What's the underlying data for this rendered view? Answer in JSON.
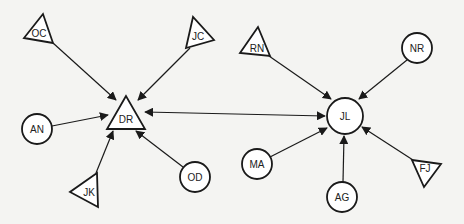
{
  "diagram": {
    "type": "directed-network",
    "colors": {
      "background": "#f4f4f2",
      "node_fill": "#ffffff",
      "stroke": "#1a1a1a",
      "text": "#222222"
    },
    "nodes": [
      {
        "id": "OC",
        "label": "OC",
        "shape": "triangle",
        "points": [
          [
            43,
            14
          ],
          [
            24,
            38
          ],
          [
            53,
            43
          ]
        ],
        "label_pos": [
          39,
          33
        ]
      },
      {
        "id": "JC",
        "label": "JC",
        "shape": "triangle",
        "points": [
          [
            193,
            17
          ],
          [
            186,
            48
          ],
          [
            214,
            40
          ]
        ],
        "label_pos": [
          198,
          36
        ]
      },
      {
        "id": "DR",
        "label": "DR",
        "shape": "triangle",
        "points": [
          [
            126,
            96
          ],
          [
            107,
            129
          ],
          [
            145,
            129
          ]
        ],
        "label_pos": [
          126,
          119
        ]
      },
      {
        "id": "AN",
        "label": "AN",
        "shape": "circle",
        "cx": 37,
        "cy": 129,
        "r": 15
      },
      {
        "id": "JK",
        "label": "JK",
        "shape": "triangle",
        "points": [
          [
            97,
            173
          ],
          [
            70,
            192
          ],
          [
            98,
            207
          ]
        ],
        "label_pos": [
          89,
          192
        ]
      },
      {
        "id": "OD",
        "label": "OD",
        "shape": "circle",
        "cx": 195,
        "cy": 177,
        "r": 15
      },
      {
        "id": "RN",
        "label": "RN",
        "shape": "triangle",
        "points": [
          [
            258,
            27
          ],
          [
            240,
            53
          ],
          [
            270,
            56
          ]
        ],
        "label_pos": [
          257,
          48
        ]
      },
      {
        "id": "NR",
        "label": "NR",
        "shape": "circle",
        "cx": 417,
        "cy": 48,
        "r": 15
      },
      {
        "id": "JL",
        "label": "JL",
        "shape": "circle",
        "cx": 345,
        "cy": 116,
        "r": 18
      },
      {
        "id": "MA",
        "label": "MA",
        "shape": "circle",
        "cx": 257,
        "cy": 164,
        "r": 15
      },
      {
        "id": "AG",
        "label": "AG",
        "shape": "circle",
        "cx": 342,
        "cy": 197,
        "r": 15
      },
      {
        "id": "FJ",
        "label": "FJ",
        "shape": "triangle",
        "points": [
          [
            412,
            160
          ],
          [
            441,
            164
          ],
          [
            424,
            187
          ]
        ],
        "label_pos": [
          425,
          168
        ]
      }
    ],
    "edges": [
      {
        "from": "OC",
        "to": "DR",
        "x1": 53,
        "y1": 43,
        "x2": 116,
        "y2": 100,
        "bidirectional": false
      },
      {
        "from": "JC",
        "to": "DR",
        "x1": 190,
        "y1": 48,
        "x2": 138,
        "y2": 100,
        "bidirectional": false
      },
      {
        "from": "AN",
        "to": "DR",
        "x1": 52,
        "y1": 126,
        "x2": 108,
        "y2": 115,
        "bidirectional": false
      },
      {
        "from": "JK",
        "to": "DR",
        "x1": 96,
        "y1": 173,
        "x2": 113,
        "y2": 131,
        "bidirectional": false
      },
      {
        "from": "OD",
        "to": "DR",
        "x1": 183,
        "y1": 167,
        "x2": 136,
        "y2": 131,
        "bidirectional": false
      },
      {
        "from": "DR",
        "to": "JL",
        "x1": 145,
        "y1": 112,
        "x2": 325,
        "y2": 116,
        "bidirectional": true
      },
      {
        "from": "RN",
        "to": "JL",
        "x1": 269,
        "y1": 56,
        "x2": 331,
        "y2": 99,
        "bidirectional": false
      },
      {
        "from": "NR",
        "to": "JL",
        "x1": 407,
        "y1": 60,
        "x2": 359,
        "y2": 99,
        "bidirectional": false
      },
      {
        "from": "MA",
        "to": "JL",
        "x1": 270,
        "y1": 157,
        "x2": 327,
        "y2": 128,
        "bidirectional": false
      },
      {
        "from": "AG",
        "to": "JL",
        "x1": 343,
        "y1": 182,
        "x2": 344,
        "y2": 136,
        "bidirectional": false
      },
      {
        "from": "FJ",
        "to": "JL",
        "x1": 413,
        "y1": 160,
        "x2": 362,
        "y2": 127,
        "bidirectional": false
      }
    ]
  }
}
